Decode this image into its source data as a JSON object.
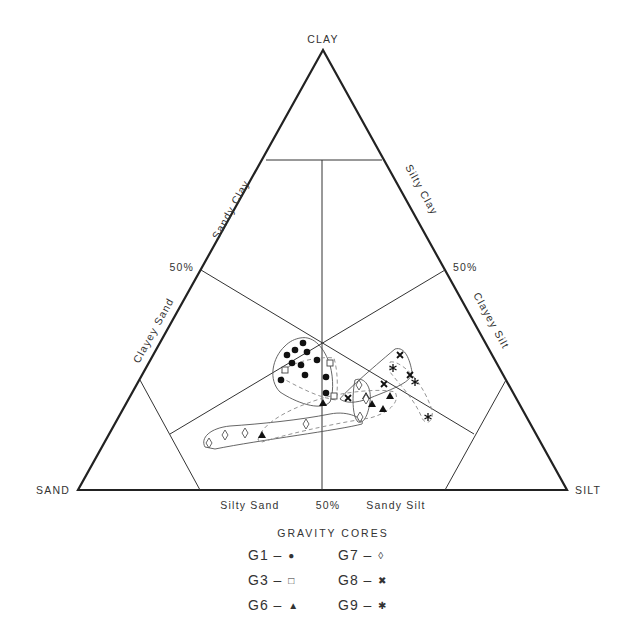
{
  "diagram": {
    "apex_labels": {
      "top": "CLAY",
      "left": "SAND",
      "right": "SILT"
    },
    "edge_labels": {
      "sandy_clay": "Sandy Clay",
      "silty_clay": "Silty Clay",
      "clayey_sand": "Clayey Sand",
      "clayey_silt": "Clayey Silt",
      "silty_sand": "Silty Sand",
      "sandy_silt": "Sandy Silt"
    },
    "percent_marks": {
      "left": "50%",
      "right": "50%",
      "bottom": "50%"
    }
  },
  "legend": {
    "title": "GRAVITY CORES",
    "items": [
      {
        "label": "G1 –",
        "symbol": "●",
        "symbol_name": "filled-circle"
      },
      {
        "label": "G7 –",
        "symbol": "◊",
        "symbol_name": "open-diamond"
      },
      {
        "label": "G3 –",
        "symbol": "□",
        "symbol_name": "open-square"
      },
      {
        "label": "G8 –",
        "symbol": "✖",
        "symbol_name": "x-cross"
      },
      {
        "label": "G6 –",
        "symbol": "▲",
        "symbol_name": "filled-triangle"
      },
      {
        "label": "G9 –",
        "symbol": "✱",
        "symbol_name": "asterisk"
      }
    ]
  },
  "points": {
    "G1": [
      [
        303,
        343
      ],
      [
        295,
        350
      ],
      [
        307,
        352
      ],
      [
        287,
        355
      ],
      [
        292,
        363
      ],
      [
        317,
        360
      ],
      [
        301,
        365
      ],
      [
        305,
        375
      ],
      [
        281,
        380
      ],
      [
        326,
        377
      ],
      [
        326,
        393
      ]
    ],
    "G3": [
      [
        330,
        363
      ],
      [
        285,
        370
      ],
      [
        334,
        396
      ]
    ],
    "G6": [
      [
        323,
        403
      ],
      [
        366,
        396
      ],
      [
        390,
        396
      ],
      [
        383,
        409
      ],
      [
        262,
        435
      ],
      [
        365,
        412
      ]
    ],
    "G7": [
      [
        359,
        385
      ],
      [
        366,
        399
      ],
      [
        360,
        417
      ],
      [
        306,
        424
      ],
      [
        245,
        433
      ],
      [
        225,
        435
      ],
      [
        209,
        443
      ]
    ],
    "G8": [
      [
        400,
        355
      ],
      [
        410,
        375
      ],
      [
        384,
        384
      ],
      [
        348,
        398
      ]
    ],
    "G9": [
      [
        393,
        368
      ],
      [
        415,
        382
      ],
      [
        428,
        417
      ]
    ]
  }
}
